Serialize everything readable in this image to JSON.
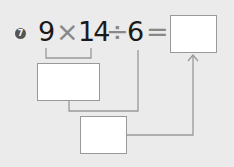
{
  "problem": {
    "number": "7",
    "tokens": [
      {
        "text": "9",
        "type": "num"
      },
      {
        "text": "×",
        "type": "op"
      },
      {
        "text": "14",
        "type": "num"
      },
      {
        "text": "÷",
        "type": "op"
      },
      {
        "text": "6",
        "type": "num"
      },
      {
        "text": "=",
        "type": "op"
      }
    ]
  },
  "boxes": {
    "answer": "",
    "step1": "",
    "step2": ""
  },
  "colors": {
    "line": "#999999",
    "badge": "#555555"
  }
}
